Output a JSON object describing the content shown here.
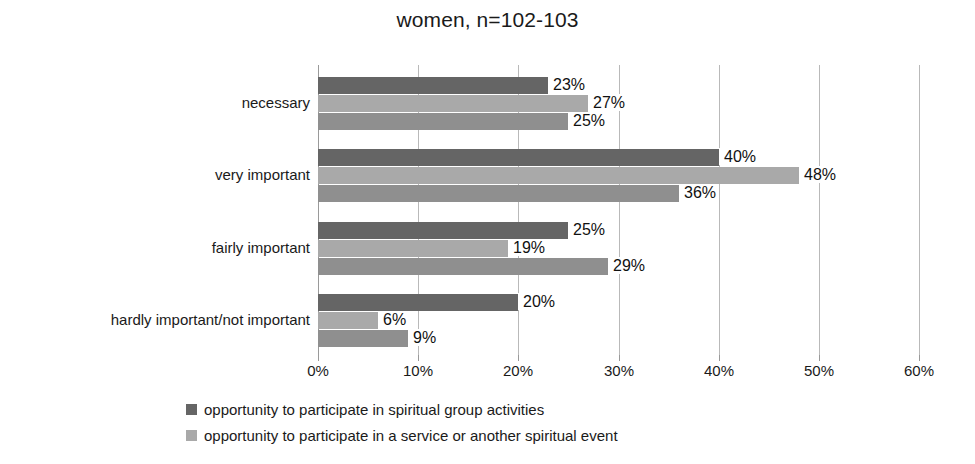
{
  "chart_data": {
    "type": "bar",
    "orientation": "horizontal",
    "title": "women, n=102-103",
    "xlabel": "",
    "ylabel": "",
    "xlim": [
      0,
      60
    ],
    "xtick_labels": [
      "0%",
      "10%",
      "20%",
      "30%",
      "40%",
      "50%",
      "60%"
    ],
    "xticks": [
      0,
      10,
      20,
      30,
      40,
      50,
      60
    ],
    "grid": true,
    "legend_position": "bottom-left",
    "categories": [
      "necessary",
      "very important",
      "fairly important",
      "hardly important/not important"
    ],
    "series": [
      {
        "name": "opportunity to participate in spiritual group activities",
        "color": "#656565",
        "values": [
          23,
          40,
          25,
          20
        ],
        "labels": [
          "23%",
          "40%",
          "25%",
          "20%"
        ],
        "in_legend": true
      },
      {
        "name": "opportunity to participate in a service or another spiritual event",
        "color": "#a9a9a9",
        "values": [
          27,
          48,
          19,
          6
        ],
        "labels": [
          "27%",
          "48%",
          "19%",
          "6%"
        ],
        "in_legend": true
      },
      {
        "name": "",
        "color": "#8f8f8f",
        "values": [
          25,
          36,
          29,
          9
        ],
        "labels": [
          "25%",
          "36%",
          "29%",
          "9%"
        ],
        "in_legend": false
      }
    ]
  },
  "legend": {
    "entries": [
      {
        "label": "opportunity to participate in spiritual group activities",
        "color": "#656565"
      },
      {
        "label": "opportunity to participate in a service or another spiritual event",
        "color": "#a9a9a9"
      }
    ]
  }
}
